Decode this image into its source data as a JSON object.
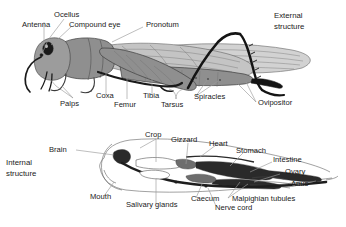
{
  "figure": {
    "background_color": "#ffffff",
    "text_color": "#1a1a1a",
    "leader_color": "#9a9a9a"
  },
  "sections": {
    "external": {
      "line1": "External",
      "line2": "structure"
    },
    "internal": {
      "line1": "Internal",
      "line2": "structure"
    }
  },
  "external_labels": {
    "ocellus": "Ocellus",
    "antenna": "Antenna",
    "compound_eye": "Compound eye",
    "pronotum": "Pronotum",
    "palps": "Palps",
    "coxa": "Coxa",
    "femur": "Femur",
    "tibia": "Tibia",
    "tarsus": "Tarsus",
    "spiracles": "Spiracles",
    "ovipositor": "Ovipositor"
  },
  "internal_labels": {
    "brain": "Brain",
    "crop": "Crop",
    "gizzard": "Gizzard",
    "heart": "Heart",
    "stomach": "Stomach",
    "intestine": "Intestine",
    "ovary": "Ovary",
    "anus": "Anus",
    "mouth": "Mouth",
    "salivary_glands": "Salivary glands",
    "caecum": "Caecum",
    "nerve_cord": "Nerve cord",
    "malpighian_tubules": "Malpighian tubules"
  }
}
